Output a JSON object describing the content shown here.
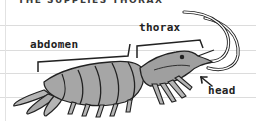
{
  "diagram": {
    "title_partial": "THE SUPPLIES THORAX",
    "labels": {
      "abdomen": "abdomen",
      "thorax": "thorax",
      "head": "head"
    },
    "colors": {
      "outline": "#222222",
      "body_light": "#b5b5b5",
      "body_mid": "#9a9a9a",
      "body_dark": "#7d7d7d",
      "rule_line": "#dcdcdc"
    }
  }
}
